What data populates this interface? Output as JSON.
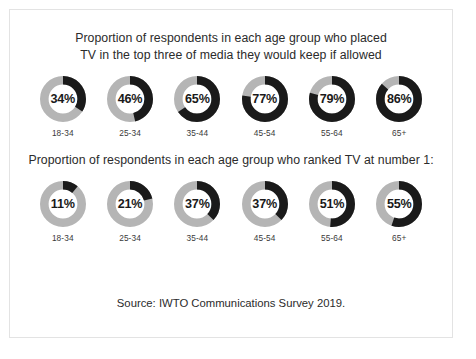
{
  "figure": {
    "source_note": "Source: IWTO Communications Survey 2019.",
    "colors": {
      "arc": "#1a1a1a",
      "track": "#b5b5b5",
      "text": "#2b2b2b",
      "border": "#e3e3e3",
      "background": "#ffffff"
    }
  },
  "sections": [
    {
      "title": "Proportion of respondents in each age group who placed\nTV in the top three of media they would keep if allowed"
    },
    {
      "title": "Proportion of respondents in each age group who ranked TV at number 1:"
    }
  ],
  "chart_data": [
    {
      "type": "pie",
      "title": "Proportion of respondents in each age group who placed TV in the top three of media they would keep if allowed",
      "xlabel": "",
      "ylabel": "",
      "categories": [
        "18-34",
        "25-34",
        "35-44",
        "45-54",
        "55-64",
        "65+"
      ],
      "values": [
        34,
        46,
        65,
        77,
        79,
        86
      ],
      "value_labels": [
        "34%",
        "46%",
        "65%",
        "77%",
        "79%",
        "86%"
      ],
      "units": "percent",
      "ylim": [
        0,
        100
      ],
      "grid": false,
      "legend": "none",
      "notes": "Six donut gauges; filled arc sweeps clockwise from top proportional to value."
    },
    {
      "type": "pie",
      "title": "Proportion of respondents in each age group who ranked TV at number 1:",
      "xlabel": "",
      "ylabel": "",
      "categories": [
        "18-34",
        "25-34",
        "35-44",
        "45-54",
        "55-64",
        "65+"
      ],
      "values": [
        11,
        21,
        37,
        37,
        51,
        55
      ],
      "value_labels": [
        "11%",
        "21%",
        "37%",
        "37%",
        "51%",
        "55%"
      ],
      "units": "percent",
      "ylim": [
        0,
        100
      ],
      "grid": false,
      "legend": "none",
      "notes": "Six donut gauges; filled arc sweeps clockwise from top proportional to value."
    }
  ]
}
